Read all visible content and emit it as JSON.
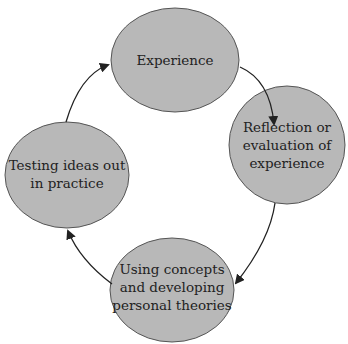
{
  "diagram": {
    "type": "cycle",
    "colors": {
      "node_fill": "#b8b8b8",
      "node_stroke": "#555555",
      "arrow": "#222222",
      "text": "#222222"
    },
    "nodes": [
      {
        "id": "experience",
        "lines": [
          "Experience"
        ]
      },
      {
        "id": "reflection",
        "lines": [
          "Reflection or",
          "evaluation of",
          "experience"
        ]
      },
      {
        "id": "concepts",
        "lines": [
          "Using concepts",
          "and developing",
          "personal theories"
        ]
      },
      {
        "id": "testing",
        "lines": [
          "Testing ideas out",
          "in practice"
        ]
      }
    ],
    "edges": [
      {
        "from": "experience",
        "to": "reflection"
      },
      {
        "from": "reflection",
        "to": "concepts"
      },
      {
        "from": "concepts",
        "to": "testing"
      },
      {
        "from": "testing",
        "to": "experience"
      }
    ]
  }
}
